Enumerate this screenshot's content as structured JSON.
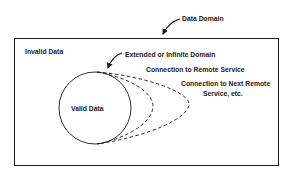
{
  "diagram": {
    "labels": {
      "data_domain": "Data Domain",
      "invalid_data": "Invalid Data",
      "extended_domain": "Extended or Infinite Domain",
      "remote_service": "Connection to Remote Service",
      "next_remote_line1": "Connection to Next Remote",
      "next_remote_line2": "Service, etc.",
      "valid_data": "Valid Data"
    },
    "colors": {
      "stroke": "#1a1a1a",
      "background": "#ffffff"
    }
  }
}
